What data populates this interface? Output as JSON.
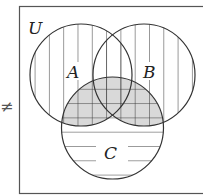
{
  "diagram": {
    "type": "venn",
    "universe_label": "U",
    "sets": [
      {
        "label": "A",
        "cx": 81,
        "cy": 75,
        "r": 51
      },
      {
        "label": "B",
        "cx": 144,
        "cy": 75,
        "r": 51
      },
      {
        "label": "C",
        "cx": 112.5,
        "cy": 128,
        "r": 51
      }
    ],
    "shading": {
      "vertical_lines": "A ∪ B",
      "horizontal_lines": "C",
      "grey_fill": "C ∩ (A ∪ B)"
    },
    "side_symbol": "≠",
    "colors": {
      "stroke": "#333333",
      "grey_fill": "#d9d9d9",
      "background": "#ffffff"
    }
  }
}
